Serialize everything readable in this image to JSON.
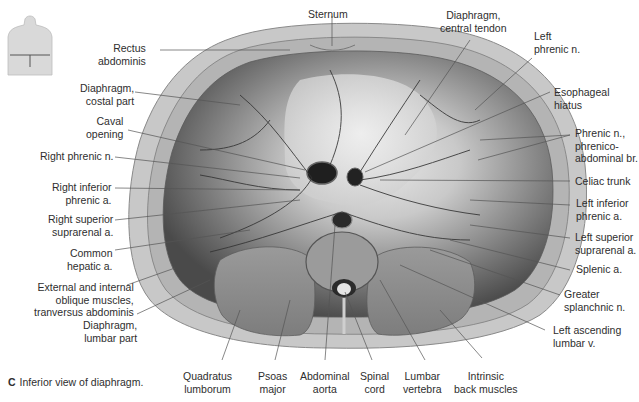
{
  "figure": {
    "caption_letter": "C",
    "caption_text": "Inferior view of diaphragm.",
    "orientation_thumbnail": "torso-thumbnail"
  },
  "labels": {
    "left": [
      {
        "id": "rectus-abdominis",
        "lines": [
          "Rectus",
          "abdominis"
        ]
      },
      {
        "id": "diaphragm-costal-part",
        "lines": [
          "Diaphragm,",
          "costal part"
        ]
      },
      {
        "id": "caval-opening",
        "lines": [
          "Caval",
          "opening"
        ]
      },
      {
        "id": "right-phrenic-n",
        "lines": [
          "Right phrenic n."
        ]
      },
      {
        "id": "right-inferior-phrenic-a",
        "lines": [
          "Right inferior",
          "phrenic a."
        ]
      },
      {
        "id": "right-superior-suprarenal-a",
        "lines": [
          "Right superior",
          "suprarenal a."
        ]
      },
      {
        "id": "common-hepatic-a",
        "lines": [
          "Common",
          "hepatic a."
        ]
      },
      {
        "id": "oblique-muscles",
        "lines": [
          "External and internal",
          "oblique muscles,",
          "tranversus abdominis"
        ]
      },
      {
        "id": "diaphragm-lumbar-part",
        "lines": [
          "Diaphragm,",
          "lumbar part"
        ]
      }
    ],
    "top": [
      {
        "id": "sternum",
        "lines": [
          "Sternum"
        ]
      },
      {
        "id": "diaphragm-central-tendon",
        "lines": [
          "Diaphragm,",
          "central tendon"
        ]
      }
    ],
    "right": [
      {
        "id": "left-phrenic-n",
        "lines": [
          "Left",
          "phrenic n."
        ]
      },
      {
        "id": "esophageal-hiatus",
        "lines": [
          "Esophageal",
          "hiatus"
        ]
      },
      {
        "id": "phrenic-n-phrenicoabdominal-br",
        "lines": [
          "Phrenic n.,",
          "phrenico-",
          "abdominal br."
        ]
      },
      {
        "id": "celiac-trunk",
        "lines": [
          "Celiac trunk"
        ]
      },
      {
        "id": "left-inferior-phrenic-a",
        "lines": [
          "Left inferior",
          "phrenic a."
        ]
      },
      {
        "id": "left-superior-suprarenal-a",
        "lines": [
          "Left superior",
          "suprarenal a."
        ]
      },
      {
        "id": "splenic-a",
        "lines": [
          "Splenic a."
        ]
      },
      {
        "id": "greater-splanchnic-n",
        "lines": [
          "Greater",
          "splanchnic n."
        ]
      },
      {
        "id": "left-ascending-lumbar-v",
        "lines": [
          "Left ascending",
          "lumbar v."
        ]
      }
    ],
    "bottom": [
      {
        "id": "quadratus-lumborum",
        "lines": [
          "Quadratus",
          "lumborum"
        ]
      },
      {
        "id": "psoas-major",
        "lines": [
          "Psoas",
          "major"
        ]
      },
      {
        "id": "abdominal-aorta",
        "lines": [
          "Abdominal",
          "aorta"
        ]
      },
      {
        "id": "spinal-cord",
        "lines": [
          "Spinal",
          "cord"
        ]
      },
      {
        "id": "lumbar-vertebra",
        "lines": [
          "Lumbar",
          "vertebra"
        ]
      },
      {
        "id": "intrinsic-back-muscles",
        "lines": [
          "Intrinsic",
          "back muscles"
        ]
      }
    ]
  },
  "colors": {
    "background": "#ffffff",
    "text": "#2e2e2e",
    "leader_line": "#555555",
    "body_wall": "#c9c9c9",
    "diaphragm_dark": "#5a5a5a",
    "central_tendon": "#e6e6e6",
    "vessel": "#3a3a3a"
  }
}
